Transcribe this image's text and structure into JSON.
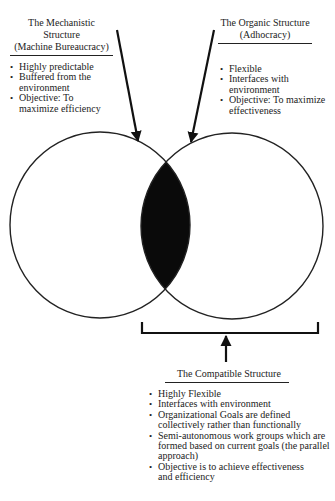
{
  "mechanistic": {
    "title_line1": "The Mechanistic Structure",
    "title_line2": "(Machine Bureaucracy)",
    "items": [
      "Highly predictable",
      "Buffered from the environment",
      "Objective: To maximize efficiency"
    ]
  },
  "organic": {
    "title_line1": "The Organic Structure",
    "title_line2": "(Adhocracy)",
    "items": [
      "Flexible",
      "Interfaces with environment",
      "Objective: To maximize effectiveness"
    ]
  },
  "compatible": {
    "title": "The Compatible Structure",
    "items": [
      "Highly Flexible",
      "Interfaces with environment",
      "Organizational Goals are defined collectively rather than functionally",
      "Semi-autonomous work groups which are formed based on current goals (the parallel approach)",
      "Objective is to achieve effectiveness and efficiency"
    ]
  },
  "bullet": "•",
  "colors": {
    "stroke": "#222222",
    "overlap_fill": "#0a0a0a",
    "background": "#ffffff"
  }
}
